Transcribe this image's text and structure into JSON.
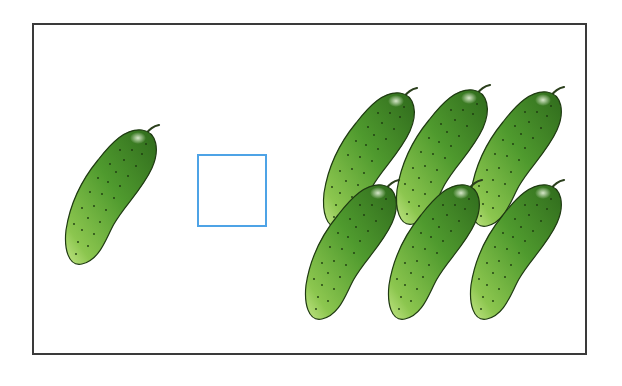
{
  "exercise": {
    "type": "counting comparison",
    "left_group": {
      "item": "cucumber",
      "count": 1
    },
    "answer_box": {
      "value": "",
      "border_color": "#4ea3e6"
    },
    "right_group": {
      "item": "cucumber",
      "count": 6,
      "rows": 2,
      "columns": 3
    }
  },
  "colors": {
    "frame": "#3a3a3a",
    "cucumber_dark": "#2f6a1c",
    "cucumber_mid": "#4f9a2e",
    "cucumber_light": "#b8e07a",
    "outline": "#1f3a12"
  },
  "cucumbers": [
    {
      "group": "left",
      "x": 62,
      "y": 120
    },
    {
      "group": "right",
      "x": 320,
      "y": 83
    },
    {
      "group": "right",
      "x": 393,
      "y": 80
    },
    {
      "group": "right",
      "x": 467,
      "y": 82
    },
    {
      "group": "right",
      "x": 302,
      "y": 175
    },
    {
      "group": "right",
      "x": 385,
      "y": 175
    },
    {
      "group": "right",
      "x": 467,
      "y": 175
    }
  ]
}
